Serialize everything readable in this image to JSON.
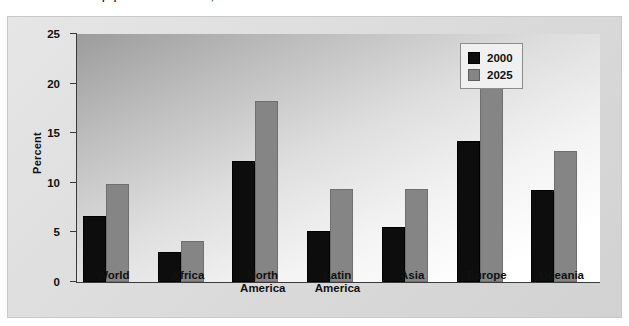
{
  "figure": {
    "number": "2",
    "title_fragment": "population 65 and older, 2000 and 2025"
  },
  "legend": {
    "position": "top-right",
    "entries": [
      {
        "label": "2000",
        "color": "#0d0d0d"
      },
      {
        "label": "2025",
        "color": "#858585"
      }
    ]
  },
  "chart_data": {
    "type": "bar",
    "title": "population 65 and older, 2000 and 2025",
    "xlabel": "",
    "ylabel": "Percent",
    "ylim": [
      0,
      25
    ],
    "yticks": [
      0,
      5,
      10,
      15,
      20,
      25
    ],
    "grid": false,
    "legend_position": "top-right",
    "categories": [
      "World",
      "Africa",
      "North America",
      "Latin America",
      "Asia",
      "Europe",
      "Oceania"
    ],
    "series": [
      {
        "name": "2000",
        "color": "#0d0d0d",
        "values": [
          6.7,
          3.0,
          12.2,
          5.1,
          5.5,
          14.2,
          9.3
        ]
      },
      {
        "name": "2025",
        "color": "#858585",
        "values": [
          9.9,
          4.1,
          18.2,
          9.4,
          9.4,
          20.0,
          13.2
        ]
      }
    ]
  }
}
